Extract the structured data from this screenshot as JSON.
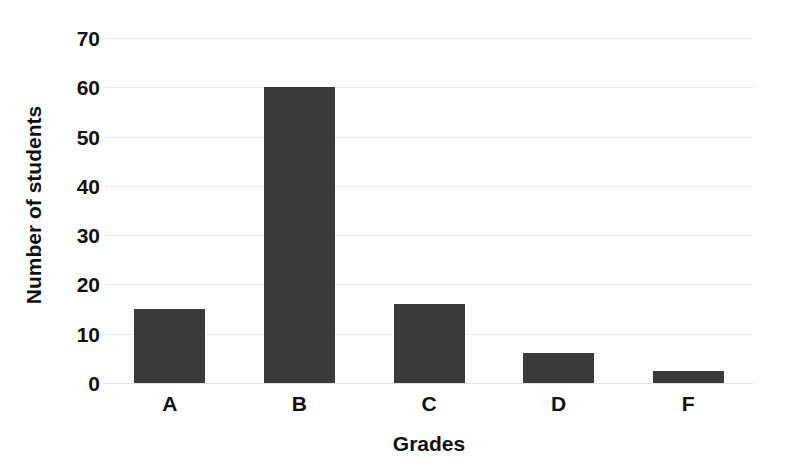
{
  "chart_data": {
    "type": "bar",
    "title": "",
    "subtitle": "",
    "xlabel": "Grades",
    "ylabel": "Number of students",
    "categories": [
      "A",
      "B",
      "C",
      "D",
      "F"
    ],
    "values": [
      15,
      60,
      16,
      6,
      2.5
    ],
    "series": [
      {
        "name": "Number of students",
        "values": [
          15,
          60,
          16,
          6,
          2.5
        ]
      }
    ],
    "ylim": [
      0,
      70
    ],
    "yticks": [
      0,
      10,
      20,
      30,
      40,
      50,
      60,
      70
    ],
    "ytick_labels": [
      "0",
      "10",
      "20",
      "30",
      "40",
      "50",
      "60",
      "70"
    ],
    "grid": true,
    "grid_axis": "y",
    "legend": false,
    "legend_position": "none",
    "bar_color": "#3a3a3a",
    "grid_color": "#ececec",
    "text_color": "#111111",
    "background_color": "#ffffff",
    "annotations": []
  }
}
